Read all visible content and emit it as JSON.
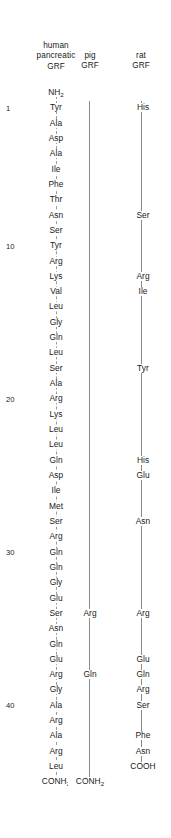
{
  "figure": {
    "columns": [
      {
        "key": "human",
        "label": "human\npancreatic\nGRF"
      },
      {
        "key": "pig",
        "label": "pig\nGRF"
      },
      {
        "key": "rat",
        "label": "rat\nGRF"
      }
    ],
    "terminus": {
      "n_terminal_human": "NH2",
      "c_terminal_human": "CONH2",
      "c_terminal_pig": "CONH2",
      "c_terminal_rat": "COOH"
    }
  },
  "sequence": {
    "numbered_positions": [
      1,
      10,
      20,
      30,
      40
    ],
    "rows": [
      {
        "n": null,
        "human": "NH2",
        "pig": "",
        "rat": ""
      },
      {
        "n": 1,
        "human": "Tyr",
        "pig": "",
        "rat": "His"
      },
      {
        "n": 2,
        "human": "Ala",
        "pig": "",
        "rat": ""
      },
      {
        "n": 3,
        "human": "Asp",
        "pig": "",
        "rat": ""
      },
      {
        "n": 4,
        "human": "Ala",
        "pig": "",
        "rat": ""
      },
      {
        "n": 5,
        "human": "Ile",
        "pig": "",
        "rat": ""
      },
      {
        "n": 6,
        "human": "Phe",
        "pig": "",
        "rat": ""
      },
      {
        "n": 7,
        "human": "Thr",
        "pig": "",
        "rat": ""
      },
      {
        "n": 8,
        "human": "Asn",
        "pig": "",
        "rat": "Ser"
      },
      {
        "n": 9,
        "human": "Ser",
        "pig": "",
        "rat": ""
      },
      {
        "n": 10,
        "human": "Tyr",
        "pig": "",
        "rat": ""
      },
      {
        "n": 11,
        "human": "Arg",
        "pig": "",
        "rat": ""
      },
      {
        "n": 12,
        "human": "Lys",
        "pig": "",
        "rat": "Arg"
      },
      {
        "n": 13,
        "human": "Val",
        "pig": "",
        "rat": "Ile"
      },
      {
        "n": 14,
        "human": "Leu",
        "pig": "",
        "rat": ""
      },
      {
        "n": 15,
        "human": "Gly",
        "pig": "",
        "rat": ""
      },
      {
        "n": 16,
        "human": "Gln",
        "pig": "",
        "rat": ""
      },
      {
        "n": 17,
        "human": "Leu",
        "pig": "",
        "rat": ""
      },
      {
        "n": 18,
        "human": "Ser",
        "pig": "",
        "rat": "Tyr"
      },
      {
        "n": 19,
        "human": "Ala",
        "pig": "",
        "rat": ""
      },
      {
        "n": 20,
        "human": "Arg",
        "pig": "",
        "rat": ""
      },
      {
        "n": 21,
        "human": "Lys",
        "pig": "",
        "rat": ""
      },
      {
        "n": 22,
        "human": "Leu",
        "pig": "",
        "rat": ""
      },
      {
        "n": 23,
        "human": "Leu",
        "pig": "",
        "rat": ""
      },
      {
        "n": 24,
        "human": "Gln",
        "pig": "",
        "rat": "His"
      },
      {
        "n": 25,
        "human": "Asp",
        "pig": "",
        "rat": "Glu"
      },
      {
        "n": 26,
        "human": "Ile",
        "pig": "",
        "rat": ""
      },
      {
        "n": 27,
        "human": "Met",
        "pig": "",
        "rat": ""
      },
      {
        "n": 28,
        "human": "Ser",
        "pig": "",
        "rat": "Asn"
      },
      {
        "n": 29,
        "human": "Arg",
        "pig": "",
        "rat": ""
      },
      {
        "n": 30,
        "human": "Gln",
        "pig": "",
        "rat": ""
      },
      {
        "n": 31,
        "human": "Gln",
        "pig": "",
        "rat": ""
      },
      {
        "n": 32,
        "human": "Gly",
        "pig": "",
        "rat": ""
      },
      {
        "n": 33,
        "human": "Glu",
        "pig": "",
        "rat": ""
      },
      {
        "n": 34,
        "human": "Ser",
        "pig": "Arg",
        "rat": "Arg"
      },
      {
        "n": 35,
        "human": "Asn",
        "pig": "",
        "rat": ""
      },
      {
        "n": 36,
        "human": "Gln",
        "pig": "",
        "rat": ""
      },
      {
        "n": 37,
        "human": "Glu",
        "pig": "",
        "rat": "Glu"
      },
      {
        "n": 38,
        "human": "Arg",
        "pig": "Gln",
        "rat": "Gln"
      },
      {
        "n": 39,
        "human": "Gly",
        "pig": "",
        "rat": "Arg"
      },
      {
        "n": 40,
        "human": "Ala",
        "pig": "",
        "rat": "Ser"
      },
      {
        "n": 41,
        "human": "Arg",
        "pig": "",
        "rat": ""
      },
      {
        "n": 42,
        "human": "Ala",
        "pig": "",
        "rat": "Phe"
      },
      {
        "n": 43,
        "human": "Arg",
        "pig": "",
        "rat": "Asn"
      },
      {
        "n": 44,
        "human": "Leu",
        "pig": "",
        "rat": "COOH"
      },
      {
        "n": null,
        "human": "CONH2",
        "pig": "CONH2",
        "rat": ""
      }
    ]
  },
  "style": {
    "text_color": "#1a1a1a",
    "line_color": "#8a8a8a",
    "dashed_line_color": "#9a9a9a",
    "background": "#ffffff"
  }
}
